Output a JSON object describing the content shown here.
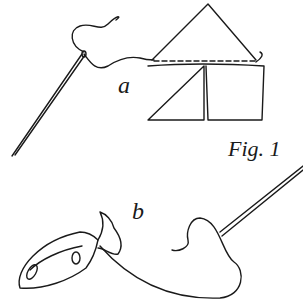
{
  "figure": {
    "caption": "Fig. 1",
    "labels": {
      "a": "a",
      "b": "b"
    },
    "parts": [
      {
        "id": "a",
        "description": "needle with thread sewing a triangular fabric piece onto a two-panel square piece along a dashed seam"
      },
      {
        "id": "b",
        "description": "gathered fabric pouch tied with thread, connected to a needle"
      }
    ],
    "colors": {
      "ink": "#1a1a1a",
      "background": "#ffffff"
    }
  }
}
